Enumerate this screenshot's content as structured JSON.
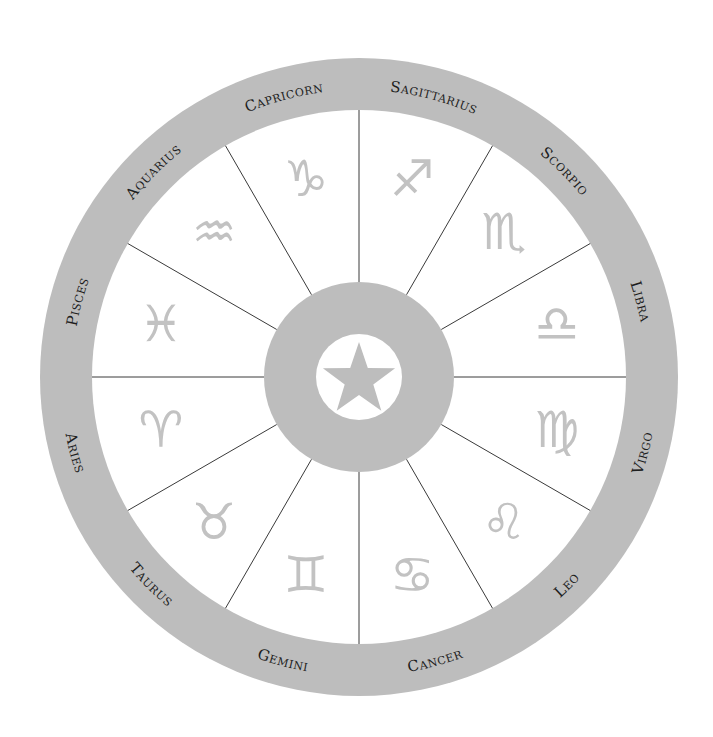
{
  "diagram": {
    "center": {
      "icon": "star-icon"
    },
    "colors": {
      "ring": "#bdbdbd",
      "glyph": "#c2c2c2",
      "label": "#1e1e1e",
      "divider": "#3a3a3a",
      "background": "#ffffff"
    },
    "signs": [
      {
        "name": "Virgo",
        "glyph": "♍",
        "icon": "virgo-icon"
      },
      {
        "name": "Leo",
        "glyph": "♌",
        "icon": "leo-icon"
      },
      {
        "name": "Cancer",
        "glyph": "♋",
        "icon": "cancer-icon"
      },
      {
        "name": "Gemini",
        "glyph": "♊",
        "icon": "gemini-icon"
      },
      {
        "name": "Taurus",
        "glyph": "♉",
        "icon": "taurus-icon"
      },
      {
        "name": "Aries",
        "glyph": "♈",
        "icon": "aries-icon"
      },
      {
        "name": "Pisces",
        "glyph": "♓",
        "icon": "pisces-icon"
      },
      {
        "name": "Aquarius",
        "glyph": "♒",
        "icon": "aquarius-icon"
      },
      {
        "name": "Capricorn",
        "glyph": "♑",
        "icon": "capricorn-icon"
      },
      {
        "name": "Sagittarius",
        "glyph": "♐",
        "icon": "sagittarius-icon"
      },
      {
        "name": "Scorpio",
        "glyph": "♏",
        "icon": "scorpio-icon"
      },
      {
        "name": "Libra",
        "glyph": "♎",
        "icon": "libra-icon"
      }
    ]
  }
}
